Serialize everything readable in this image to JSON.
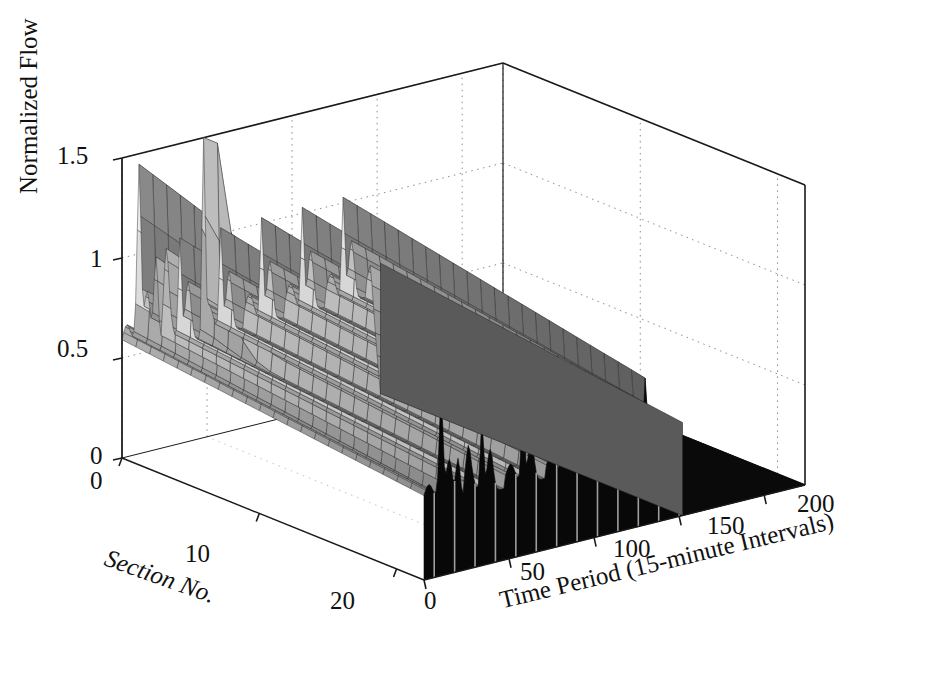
{
  "figure": {
    "kind": "3d-surface-mesh",
    "background": "#ffffff",
    "ink": "#000000"
  },
  "axes": {
    "z": {
      "title": "Normalized Flow",
      "ticks": [
        "1.5",
        "1",
        "0.5",
        "0"
      ],
      "values": [
        1.5,
        1.0,
        0.5,
        0.0
      ],
      "range": [
        0,
        1.5
      ]
    },
    "x": {
      "title": "Section No.",
      "ticks": [
        "0",
        "10",
        "20"
      ],
      "values": [
        0,
        10,
        20
      ],
      "range": [
        0,
        22
      ]
    },
    "y": {
      "title": "Time Period (15-minute Intervals)",
      "ticks": [
        "0",
        "50",
        "100",
        "150",
        "200"
      ],
      "values": [
        0,
        50,
        100,
        150,
        200
      ],
      "range": [
        0,
        224
      ]
    }
  },
  "chart_data": {
    "type": "line",
    "xlabel": "Time Period (15-minute Intervals)",
    "ylabel": "Normalized Flow",
    "zlabel": "Section No.",
    "grid": true,
    "legend": null,
    "xlim": [
      0,
      224
    ],
    "ylim": [
      0,
      1.5
    ],
    "zlim": [
      0,
      22
    ],
    "x": [
      0,
      7,
      14,
      21,
      28,
      35,
      42,
      49,
      56,
      63,
      70,
      77,
      84,
      91,
      98,
      105,
      112,
      119,
      126,
      133,
      140,
      147,
      154,
      161,
      168,
      175,
      182,
      189,
      196,
      203,
      210,
      217,
      224
    ],
    "series": [
      {
        "name": "Section 1",
        "values": [
          0.55,
          0.8,
          1.28,
          0.62,
          1.18,
          1.32,
          0.7,
          0.95,
          1.0,
          0.72,
          0.96,
          0.98,
          0.74,
          0.95,
          0.97,
          0.75,
          0.96,
          0.98,
          0.76,
          0.97,
          0.99,
          0.78,
          0.98,
          1.0,
          0.8,
          0.99,
          1.01,
          0.82,
          1.0,
          0.96,
          0.0,
          0.0,
          0.0
        ]
      },
      {
        "name": "Section 2",
        "values": [
          0.54,
          0.78,
          1.22,
          0.6,
          1.12,
          1.26,
          0.68,
          0.93,
          0.99,
          0.7,
          0.94,
          0.97,
          0.72,
          0.94,
          0.96,
          0.74,
          0.95,
          0.97,
          0.75,
          0.96,
          0.98,
          0.77,
          0.97,
          0.99,
          0.79,
          0.98,
          1.0,
          0.81,
          0.99,
          0.95,
          0.0,
          0.0,
          0.0
        ]
      },
      {
        "name": "Section 3",
        "values": [
          0.53,
          0.75,
          1.1,
          0.58,
          1.05,
          1.18,
          0.66,
          0.92,
          0.98,
          0.69,
          0.93,
          0.96,
          0.71,
          0.93,
          0.95,
          0.73,
          0.94,
          0.96,
          0.74,
          0.95,
          0.97,
          0.76,
          0.96,
          0.98,
          0.78,
          0.97,
          0.99,
          0.8,
          0.98,
          0.94,
          0.0,
          0.0,
          0.0
        ]
      },
      {
        "name": "Section 4",
        "values": [
          0.52,
          0.72,
          0.98,
          0.56,
          0.98,
          1.06,
          0.64,
          0.9,
          0.97,
          0.68,
          0.92,
          0.95,
          0.7,
          0.92,
          0.94,
          0.72,
          0.93,
          0.95,
          0.73,
          0.94,
          0.96,
          0.75,
          0.95,
          0.97,
          0.77,
          0.96,
          0.98,
          0.79,
          0.97,
          0.93,
          0.0,
          0.0,
          0.0
        ]
      },
      {
        "name": "Section 5",
        "values": [
          0.51,
          0.7,
          0.92,
          0.55,
          0.93,
          0.99,
          0.63,
          0.89,
          0.96,
          0.67,
          0.91,
          0.94,
          0.69,
          0.91,
          0.93,
          0.71,
          0.92,
          0.94,
          0.72,
          0.93,
          0.95,
          0.74,
          0.94,
          0.96,
          0.76,
          0.95,
          0.97,
          0.78,
          0.96,
          0.92,
          0.0,
          0.0,
          0.0
        ]
      },
      {
        "name": "Section 6",
        "values": [
          0.5,
          0.69,
          0.89,
          0.54,
          0.9,
          0.96,
          0.62,
          0.88,
          0.95,
          0.66,
          0.9,
          0.93,
          0.68,
          0.9,
          0.92,
          0.7,
          0.91,
          0.93,
          0.71,
          0.92,
          0.94,
          0.73,
          0.93,
          0.95,
          0.75,
          0.94,
          0.96,
          0.77,
          0.95,
          0.91,
          0.0,
          0.0,
          0.0
        ]
      },
      {
        "name": "Section 7",
        "values": [
          0.5,
          0.68,
          0.88,
          0.53,
          0.89,
          0.95,
          0.61,
          0.88,
          0.94,
          0.65,
          0.89,
          0.92,
          0.67,
          0.89,
          0.91,
          0.69,
          0.9,
          0.92,
          0.7,
          0.91,
          0.93,
          0.72,
          0.92,
          0.94,
          0.74,
          0.93,
          0.95,
          0.76,
          0.94,
          0.9,
          0.0,
          0.0,
          0.0
        ]
      },
      {
        "name": "Section 8",
        "values": [
          0.49,
          0.67,
          0.87,
          0.52,
          0.88,
          0.94,
          0.6,
          0.87,
          0.93,
          0.64,
          0.88,
          0.91,
          0.66,
          0.88,
          0.9,
          0.68,
          0.89,
          0.91,
          0.69,
          0.9,
          0.92,
          0.71,
          0.91,
          0.93,
          0.73,
          0.92,
          0.94,
          0.75,
          0.93,
          0.89,
          0.0,
          0.0,
          0.0
        ]
      },
      {
        "name": "Section 9",
        "values": [
          0.49,
          0.66,
          0.86,
          0.52,
          0.87,
          0.93,
          0.6,
          0.86,
          0.92,
          0.63,
          0.87,
          0.9,
          0.65,
          0.87,
          0.89,
          0.67,
          0.88,
          0.9,
          0.68,
          0.89,
          0.91,
          0.7,
          0.9,
          0.92,
          0.72,
          0.91,
          0.93,
          0.74,
          0.92,
          0.88,
          0.0,
          0.0,
          0.0
        ]
      },
      {
        "name": "Section 10",
        "values": [
          0.48,
          0.65,
          0.85,
          0.51,
          0.86,
          0.92,
          0.59,
          0.85,
          0.91,
          0.62,
          0.86,
          0.89,
          0.64,
          0.86,
          0.88,
          0.66,
          0.87,
          0.89,
          0.67,
          0.88,
          0.9,
          0.69,
          0.89,
          0.91,
          0.71,
          0.9,
          0.92,
          0.73,
          0.91,
          0.87,
          0.0,
          0.0,
          0.0
        ]
      },
      {
        "name": "Section 11",
        "values": [
          0.48,
          0.64,
          0.84,
          0.51,
          0.85,
          0.91,
          0.58,
          0.84,
          0.9,
          0.61,
          0.85,
          0.88,
          0.63,
          0.85,
          0.87,
          0.65,
          0.86,
          0.88,
          0.66,
          0.87,
          0.89,
          0.68,
          0.88,
          0.9,
          0.7,
          0.89,
          0.91,
          0.72,
          0.9,
          0.86,
          0.0,
          0.0,
          0.0
        ]
      },
      {
        "name": "Section 12",
        "values": [
          0.47,
          0.63,
          0.83,
          0.5,
          0.84,
          0.9,
          0.57,
          0.83,
          0.89,
          0.6,
          0.84,
          0.87,
          0.62,
          0.84,
          0.86,
          0.64,
          0.85,
          0.87,
          0.65,
          0.86,
          0.88,
          0.67,
          0.87,
          0.89,
          0.69,
          0.88,
          0.9,
          0.71,
          0.89,
          0.85,
          0.0,
          0.0,
          0.0
        ]
      },
      {
        "name": "Section 13",
        "values": [
          0.47,
          0.62,
          0.82,
          0.5,
          0.83,
          0.89,
          0.56,
          0.82,
          0.88,
          0.59,
          0.83,
          0.86,
          0.61,
          0.83,
          0.85,
          0.63,
          0.84,
          0.86,
          0.64,
          0.85,
          0.87,
          0.66,
          0.86,
          0.88,
          0.68,
          0.87,
          0.89,
          0.7,
          0.88,
          0.84,
          0.0,
          0.0,
          0.0
        ]
      },
      {
        "name": "Section 14",
        "values": [
          0.46,
          0.61,
          0.81,
          0.49,
          0.82,
          0.88,
          0.55,
          0.81,
          0.87,
          0.58,
          0.82,
          0.85,
          0.6,
          0.82,
          0.84,
          0.62,
          0.83,
          0.85,
          0.63,
          0.84,
          0.86,
          0.65,
          0.85,
          0.87,
          0.67,
          0.86,
          0.88,
          0.69,
          0.87,
          0.83,
          0.0,
          0.0,
          0.0
        ]
      },
      {
        "name": "Section 15",
        "values": [
          0.46,
          0.6,
          0.8,
          0.49,
          0.81,
          0.87,
          0.54,
          0.8,
          0.86,
          0.57,
          0.81,
          0.84,
          0.59,
          0.81,
          0.83,
          0.61,
          0.82,
          0.84,
          0.62,
          0.83,
          0.85,
          0.64,
          0.84,
          0.86,
          0.66,
          0.85,
          0.87,
          0.68,
          0.86,
          0.82,
          0.0,
          0.0,
          0.0
        ]
      },
      {
        "name": "Section 16",
        "values": [
          0.45,
          0.59,
          0.79,
          0.48,
          0.8,
          0.86,
          0.53,
          0.79,
          0.85,
          0.56,
          0.8,
          0.83,
          0.58,
          0.8,
          0.82,
          0.6,
          0.81,
          0.83,
          0.61,
          0.82,
          0.84,
          0.63,
          0.83,
          0.85,
          0.65,
          0.84,
          0.86,
          0.67,
          0.85,
          0.81,
          0.0,
          0.0,
          0.0
        ]
      },
      {
        "name": "Section 17",
        "values": [
          0.45,
          0.58,
          0.78,
          0.48,
          0.79,
          0.85,
          0.52,
          0.78,
          0.84,
          0.55,
          0.79,
          0.82,
          0.57,
          0.79,
          0.81,
          0.59,
          0.8,
          0.82,
          0.6,
          0.81,
          0.83,
          0.62,
          0.82,
          0.84,
          0.64,
          0.83,
          0.85,
          0.66,
          0.84,
          0.8,
          0.0,
          0.0,
          0.0
        ]
      },
      {
        "name": "Section 18",
        "values": [
          0.44,
          0.57,
          0.77,
          0.47,
          0.78,
          0.84,
          0.51,
          0.77,
          0.83,
          0.54,
          0.78,
          0.81,
          0.56,
          0.78,
          0.8,
          0.58,
          0.79,
          0.81,
          0.59,
          0.8,
          0.82,
          0.61,
          0.81,
          0.83,
          0.63,
          0.82,
          0.84,
          0.65,
          0.83,
          0.79,
          0.0,
          0.0,
          0.0
        ]
      },
      {
        "name": "Section 19",
        "values": [
          0.44,
          0.56,
          0.76,
          0.47,
          0.77,
          0.83,
          0.5,
          0.76,
          0.82,
          0.53,
          0.77,
          0.8,
          0.55,
          0.77,
          0.79,
          0.57,
          0.78,
          0.8,
          0.58,
          0.79,
          0.81,
          0.6,
          0.8,
          0.82,
          0.62,
          0.81,
          0.83,
          0.64,
          0.82,
          0.78,
          0.0,
          0.0,
          0.0
        ]
      },
      {
        "name": "Section 20",
        "values": [
          0.43,
          0.55,
          0.75,
          0.46,
          0.76,
          0.82,
          0.49,
          0.75,
          0.81,
          0.52,
          0.76,
          0.79,
          0.54,
          0.76,
          0.78,
          0.56,
          0.77,
          0.79,
          0.57,
          0.78,
          0.8,
          0.59,
          0.79,
          0.81,
          0.61,
          0.8,
          0.82,
          0.63,
          0.81,
          0.77,
          0.0,
          0.0,
          0.0
        ]
      },
      {
        "name": "Section 21",
        "values": [
          0.43,
          0.54,
          0.74,
          0.46,
          0.75,
          0.81,
          0.48,
          0.74,
          0.8,
          0.51,
          0.75,
          0.78,
          0.53,
          0.75,
          0.77,
          0.55,
          0.76,
          0.78,
          0.56,
          0.77,
          0.79,
          0.58,
          0.78,
          0.8,
          0.6,
          0.79,
          0.81,
          0.62,
          0.8,
          0.76,
          0.0,
          0.0,
          0.0
        ]
      },
      {
        "name": "Section 22",
        "values": [
          0.42,
          0.53,
          0.73,
          0.45,
          0.74,
          0.8,
          0.47,
          0.73,
          0.79,
          0.5,
          0.74,
          0.77,
          0.52,
          0.74,
          0.76,
          0.54,
          0.75,
          0.77,
          0.55,
          0.76,
          0.78,
          0.57,
          0.77,
          0.79,
          0.59,
          0.78,
          0.8,
          0.61,
          0.79,
          0.75,
          0.0,
          0.0,
          0.0
        ]
      }
    ],
    "annotations": [
      {
        "label": "isolated narrow spike",
        "x": 48,
        "y": 1.5,
        "section": 1
      },
      {
        "label": "flow terminates",
        "x": 152,
        "y": 0.0
      }
    ]
  },
  "render": {
    "nx": 22,
    "nt": 224,
    "cutoff_t": 152,
    "spike_t": 48,
    "spike_height": 1.5,
    "period": 24
  }
}
